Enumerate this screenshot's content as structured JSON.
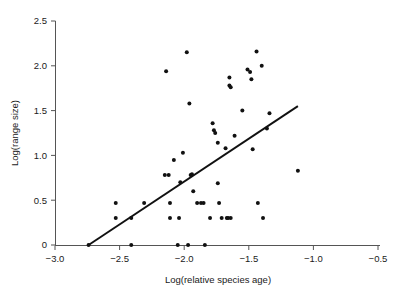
{
  "chart_data": {
    "type": "scatter",
    "title": "",
    "subtitle": "",
    "xlabel": "Log(relative species age)",
    "ylabel": "Log(range size)",
    "xlim": [
      -3.0,
      -0.5
    ],
    "ylim": [
      0,
      2.5
    ],
    "xticks": [
      -3.0,
      -2.5,
      -2.0,
      -1.5,
      -1.0,
      -0.5
    ],
    "xtick_labels": [
      "−3.0",
      "−2.5",
      "−2.0",
      "−1.5",
      "−1.0",
      "−0.5"
    ],
    "yticks": [
      0,
      0.5,
      1.0,
      1.5,
      2.0,
      2.5
    ],
    "ytick_labels": [
      "0",
      "0.5",
      "1.0",
      "1.5",
      "2.0",
      "2.5"
    ],
    "grid": false,
    "legend": null,
    "annotations": [],
    "marker": {
      "shape": "circle",
      "size": 2.0,
      "color": "#111111"
    },
    "points": [
      {
        "x": -2.74,
        "y": 0.0
      },
      {
        "x": -2.41,
        "y": 0.0
      },
      {
        "x": -2.05,
        "y": 0.0
      },
      {
        "x": -1.97,
        "y": 0.0
      },
      {
        "x": -1.84,
        "y": 0.0
      },
      {
        "x": -2.53,
        "y": 0.47
      },
      {
        "x": -2.53,
        "y": 0.3
      },
      {
        "x": -2.41,
        "y": 0.3
      },
      {
        "x": -2.31,
        "y": 0.47
      },
      {
        "x": -2.15,
        "y": 0.78
      },
      {
        "x": -2.12,
        "y": 0.78
      },
      {
        "x": -2.14,
        "y": 1.94
      },
      {
        "x": -2.11,
        "y": 0.47
      },
      {
        "x": -2.11,
        "y": 0.3
      },
      {
        "x": -2.08,
        "y": 0.95
      },
      {
        "x": -2.04,
        "y": 0.3
      },
      {
        "x": -2.03,
        "y": 0.7
      },
      {
        "x": -2.01,
        "y": 1.03
      },
      {
        "x": -1.98,
        "y": 2.15
      },
      {
        "x": -1.96,
        "y": 1.58
      },
      {
        "x": -1.95,
        "y": 0.78
      },
      {
        "x": -1.94,
        "y": 0.79
      },
      {
        "x": -1.93,
        "y": 0.6
      },
      {
        "x": -1.9,
        "y": 0.47
      },
      {
        "x": -1.87,
        "y": 0.47
      },
      {
        "x": -1.85,
        "y": 0.47
      },
      {
        "x": -1.8,
        "y": 0.3
      },
      {
        "x": -1.78,
        "y": 1.36
      },
      {
        "x": -1.77,
        "y": 1.28
      },
      {
        "x": -1.76,
        "y": 1.25
      },
      {
        "x": -1.74,
        "y": 1.14
      },
      {
        "x": -1.74,
        "y": 0.69
      },
      {
        "x": -1.73,
        "y": 0.47
      },
      {
        "x": -1.71,
        "y": 0.3
      },
      {
        "x": -1.68,
        "y": 1.08
      },
      {
        "x": -1.67,
        "y": 0.3
      },
      {
        "x": -1.66,
        "y": 0.3
      },
      {
        "x": -1.65,
        "y": 1.87
      },
      {
        "x": -1.65,
        "y": 1.78
      },
      {
        "x": -1.64,
        "y": 1.76
      },
      {
        "x": -1.64,
        "y": 0.3
      },
      {
        "x": -1.61,
        "y": 1.22
      },
      {
        "x": -1.55,
        "y": 1.5
      },
      {
        "x": -1.51,
        "y": 1.96
      },
      {
        "x": -1.49,
        "y": 1.93
      },
      {
        "x": -1.48,
        "y": 1.85
      },
      {
        "x": -1.47,
        "y": 1.07
      },
      {
        "x": -1.44,
        "y": 2.16
      },
      {
        "x": -1.43,
        "y": 0.47
      },
      {
        "x": -1.4,
        "y": 2.0
      },
      {
        "x": -1.39,
        "y": 0.3
      },
      {
        "x": -1.36,
        "y": 1.3
      },
      {
        "x": -1.34,
        "y": 1.47
      },
      {
        "x": -1.12,
        "y": 0.83
      }
    ],
    "trend_line": {
      "type": "linear-fit",
      "x_start": -2.74,
      "y_start": 0.0,
      "x_end": -1.12,
      "y_end": 1.55
    }
  },
  "axis": {
    "x_title": "Log(relative species age)",
    "y_title": "Log(range size)"
  }
}
